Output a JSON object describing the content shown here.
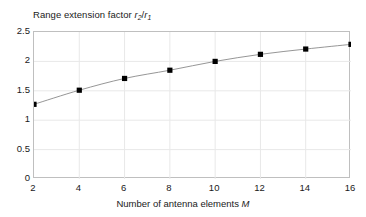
{
  "chart_data": {
    "type": "line",
    "title": "Range extension factor r2/r1",
    "title_parts": {
      "prefix": "Range extension factor ",
      "r_sym": "r",
      "sub2": "2",
      "slash": "/",
      "sub1": "1"
    },
    "xlabel": "Number of antenna elements M",
    "xlabel_parts": {
      "text": "Number of antenna elements ",
      "symbol": "M"
    },
    "ylabel": "",
    "x": [
      2,
      4,
      6,
      8,
      10,
      12,
      14,
      16
    ],
    "values": [
      1.27,
      1.51,
      1.71,
      1.85,
      2.0,
      2.12,
      2.21,
      2.29
    ],
    "series": [
      {
        "name": "Range extension factor",
        "values": [
          1.27,
          1.51,
          1.71,
          1.85,
          2.0,
          2.12,
          2.21,
          2.29
        ]
      }
    ],
    "xlim": [
      2,
      16
    ],
    "ylim": [
      0,
      2.5
    ],
    "xticks": [
      "2",
      "4",
      "6",
      "8",
      "10",
      "12",
      "14",
      "16"
    ],
    "yticks": [
      "0",
      "0.5",
      "1",
      "1.5",
      "2",
      "2.5"
    ],
    "xtick_values": [
      2,
      4,
      6,
      8,
      10,
      12,
      14,
      16
    ],
    "ytick_values": [
      0,
      0.5,
      1,
      1.5,
      2,
      2.5
    ],
    "grid": true,
    "legend": null,
    "marker": "square",
    "colors": {
      "marker": "#000000",
      "line": "#8a8a8a",
      "grid": "#e8e8e8",
      "frame": "#bfbfbf",
      "text": "#1a1a1a",
      "background": "#ffffff"
    }
  }
}
